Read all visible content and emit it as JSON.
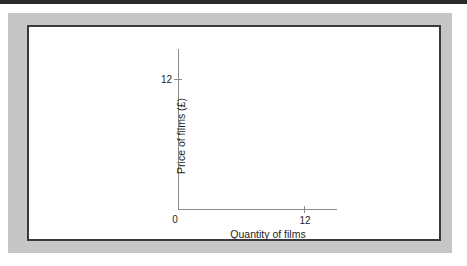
{
  "figure": {
    "frame_color": "#c6c6c6",
    "keyline_color": "#3a3a3a",
    "canvas_color": "#ffffff",
    "axis_color": "#8a8a8a",
    "text_color": "#1e1e1e",
    "top_rule_color": "#2b2b2b"
  },
  "chart_data": {
    "type": "line",
    "title": "",
    "subtitle": "",
    "xlabel": "Quantity of films",
    "ylabel": "Price of films (£)",
    "origin_label": "0",
    "x_ticks": [
      "12"
    ],
    "y_ticks": [
      "12"
    ],
    "x_tick_values": [
      12
    ],
    "y_tick_values": [
      12
    ],
    "xlim": [
      0,
      15
    ],
    "ylim": [
      0,
      15
    ],
    "grid": false,
    "legend": null,
    "series": [],
    "annotations": [],
    "note": "Blank axes template: no data plotted"
  }
}
